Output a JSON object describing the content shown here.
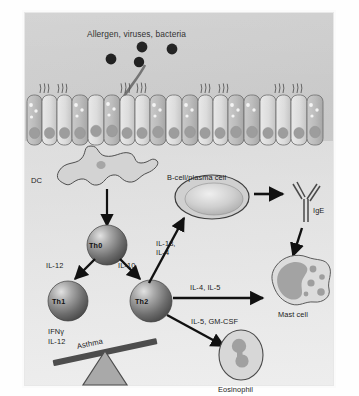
{
  "figure": {
    "title": "Allergen, viruses, bacteria",
    "panel_bg": "#cdcdcd"
  },
  "pathogens": {
    "name": "allergen-virus-bacteria-particles",
    "count": 4,
    "color": "#141414"
  },
  "epithelium": {
    "label": "airway-epithelium",
    "cell_count": 19,
    "cilia_tufts": 5
  },
  "cells": {
    "dc": {
      "label": "DC",
      "full": "dendritic cell"
    },
    "th0": {
      "label": "Th0"
    },
    "th1": {
      "label": "Th1"
    },
    "th2": {
      "label": "Th2"
    },
    "bcell": {
      "label": "B-cell/plasma cell"
    },
    "ige": {
      "label": "IgE"
    },
    "mast": {
      "label": "Mast cell"
    },
    "eosinophil": {
      "label": "Eosinophil"
    }
  },
  "cytokines": {
    "th0_to_th1": "IL-12",
    "th0_to_th2": "IL-10",
    "th1_output_line1": "IFNγ",
    "th1_output_line2": "IL-12",
    "th2_to_bcell_line1": "IL-13,",
    "th2_to_bcell_line2": "IL-4",
    "th2_to_mast": "IL-4, IL-5",
    "th2_to_eosinophil": "IL-5, GM-CSF"
  },
  "balance": {
    "label": "Asthma",
    "name": "asthma-seesaw"
  },
  "colors": {
    "arrow_black": "#111111",
    "arrow_gray": "#6f6f6f",
    "cell_fill": "#b9b9b9",
    "nucleus": "#9a9a9a",
    "sphere_dark": "#5a5a5a",
    "sphere_light": "#d8d8d8"
  }
}
